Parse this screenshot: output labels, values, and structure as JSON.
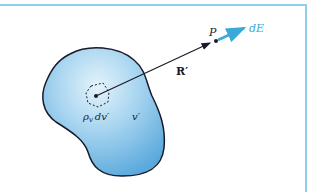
{
  "figure": {
    "volume_label": "𝑣′",
    "charge_element_label": "ρv dv′",
    "charge_density_symbol": "ρ",
    "charge_density_subscript": "v",
    "volume_element": "dv′",
    "point_label": "P",
    "vector_label": "R′",
    "field_label": "dE"
  },
  "colors": {
    "border": "#8fd0e8",
    "volume_fill_light": "#d6edf9",
    "volume_fill_dark": "#5aa9dc",
    "outline": "#1a1a2a",
    "field_arrow": "#3aa8d8",
    "field_label": "#3aa8d8"
  }
}
